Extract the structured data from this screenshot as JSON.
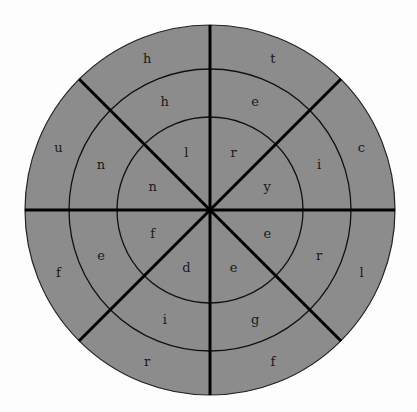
{
  "puzzle": {
    "type": "circular-word-wheel",
    "center": [
      210,
      210
    ],
    "radii": {
      "outer": 185,
      "middle": 141,
      "inner": 93
    },
    "sectors": 8,
    "colors": {
      "background": "#fdfdfd",
      "fill": "#8c8c8c",
      "ring_line": "#111111",
      "spoke_line": "#000000",
      "letter": "#1a1a1a"
    },
    "rings": {
      "outer": {
        "letters": [
          "t",
          "c",
          "l",
          "f",
          "r",
          "f",
          "u",
          "h"
        ]
      },
      "middle": {
        "letters": [
          "e",
          "i",
          "r",
          "g",
          "i",
          "e",
          "n",
          "h"
        ]
      },
      "inner": {
        "letters": [
          "r",
          "y",
          "e",
          "e",
          "d",
          "f",
          "n",
          "l"
        ]
      }
    }
  }
}
